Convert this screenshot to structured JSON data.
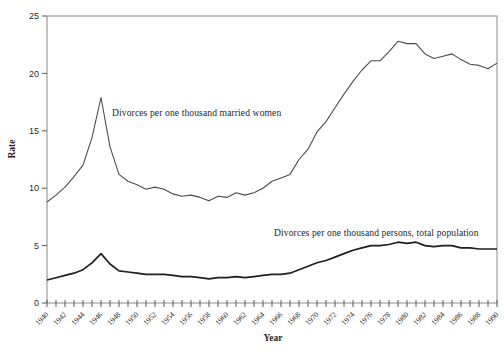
{
  "figure": {
    "background": "#ffffff"
  },
  "colors": {
    "axis_box": "#8a8a8a",
    "tick": "#5a5a5a",
    "tick_text": "#2b2b2b",
    "annotation_text": "#1f1f1f"
  },
  "chart_data": {
    "type": "line",
    "title": "",
    "xlabel": "Year",
    "ylabel": "Rate",
    "xlim": [
      1940,
      1990
    ],
    "ylim": [
      0,
      25
    ],
    "grid": false,
    "legend_position": "inline-annotations",
    "y_ticks": [
      0,
      5,
      10,
      15,
      20,
      25
    ],
    "x_tick_every": 1,
    "x_label_every": 2,
    "x": [
      1940,
      1941,
      1942,
      1943,
      1944,
      1945,
      1946,
      1947,
      1948,
      1949,
      1950,
      1951,
      1952,
      1953,
      1954,
      1955,
      1956,
      1957,
      1958,
      1959,
      1960,
      1961,
      1962,
      1963,
      1964,
      1965,
      1966,
      1967,
      1968,
      1969,
      1970,
      1971,
      1972,
      1973,
      1974,
      1975,
      1976,
      1977,
      1978,
      1979,
      1980,
      1981,
      1982,
      1983,
      1984,
      1985,
      1986,
      1987,
      1988,
      1989,
      1990
    ],
    "series": [
      {
        "name": "Divorces per one thousand married women",
        "color": "#4d4d4d",
        "stroke_width": 1.1,
        "values": [
          8.8,
          9.4,
          10.1,
          11.0,
          12.0,
          14.4,
          17.9,
          13.6,
          11.2,
          10.6,
          10.3,
          9.9,
          10.1,
          9.9,
          9.5,
          9.3,
          9.4,
          9.2,
          8.9,
          9.3,
          9.2,
          9.6,
          9.4,
          9.6,
          10.0,
          10.6,
          10.9,
          11.2,
          12.5,
          13.4,
          14.9,
          15.8,
          17.0,
          18.2,
          19.3,
          20.3,
          21.1,
          21.1,
          21.9,
          22.8,
          22.6,
          22.6,
          21.7,
          21.3,
          21.5,
          21.7,
          21.2,
          20.8,
          20.7,
          20.4,
          20.9
        ]
      },
      {
        "name": "Divorces per one thousand persons, total population",
        "color": "#1f1f1f",
        "stroke_width": 1.7,
        "values": [
          2.0,
          2.2,
          2.4,
          2.6,
          2.9,
          3.5,
          4.3,
          3.4,
          2.8,
          2.7,
          2.6,
          2.5,
          2.5,
          2.5,
          2.4,
          2.3,
          2.3,
          2.2,
          2.1,
          2.2,
          2.2,
          2.3,
          2.2,
          2.3,
          2.4,
          2.5,
          2.5,
          2.6,
          2.9,
          3.2,
          3.5,
          3.7,
          4.0,
          4.3,
          4.6,
          4.8,
          5.0,
          5.0,
          5.1,
          5.3,
          5.2,
          5.3,
          5.0,
          4.9,
          5.0,
          5.0,
          4.8,
          4.8,
          4.7,
          4.7,
          4.7
        ]
      }
    ],
    "annotations": [
      {
        "text": "Divorces per one thousand married women"
      },
      {
        "text": "Divorces per one thousand persons, total population"
      }
    ]
  }
}
